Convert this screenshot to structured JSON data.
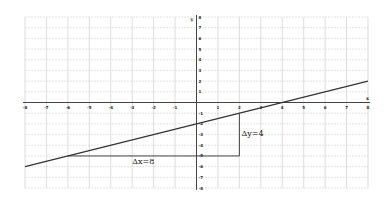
{
  "chart_data": {
    "type": "line",
    "title": "",
    "xlabel": "x",
    "ylabel": "y",
    "xlim": [
      -8,
      8
    ],
    "ylim": [
      -8,
      8
    ],
    "grid": true,
    "x_ticks": [
      -8,
      -7,
      -6,
      -5,
      -4,
      -3,
      -2,
      -1,
      1,
      2,
      3,
      4,
      5,
      6,
      7,
      8
    ],
    "y_ticks": [
      8,
      7,
      6,
      5,
      4,
      3,
      2,
      1,
      -1,
      -2,
      -3,
      -4,
      -5,
      -6,
      -7,
      -8
    ],
    "series": [
      {
        "name": "line",
        "equation": "y = 0.5x - 2",
        "slope": 0.5,
        "intercept": -2,
        "x": [
          -8,
          8
        ],
        "y": [
          -6,
          2
        ]
      }
    ],
    "slope_triangle": {
      "start": [
        -6,
        -5
      ],
      "corner": [
        2,
        -5
      ],
      "end": [
        2,
        -1
      ],
      "dx_label": "Δx=8",
      "dy_label": "Δy=4"
    },
    "legend": null
  }
}
